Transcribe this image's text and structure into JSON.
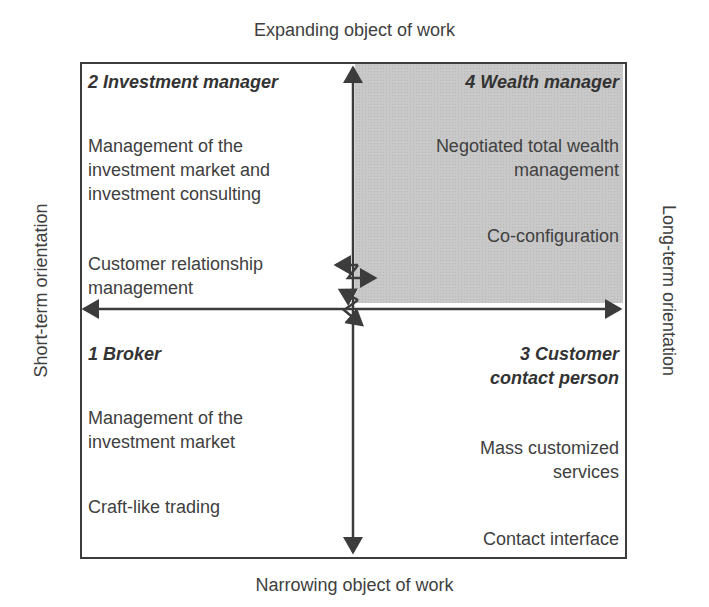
{
  "axes": {
    "top": "Expanding object of work",
    "bottom": "Narrowing object of work",
    "left": "Short-term orientation",
    "right": "Long-term orientation"
  },
  "quadrants": {
    "q2": {
      "title": "2 Investment manager",
      "items": [
        "Management of the investment market and investment consulting",
        "Customer relationship management"
      ],
      "lines": [
        "Management of the",
        "investment market and",
        "investment consulting",
        "Customer relationship",
        "management"
      ]
    },
    "q4": {
      "title": "4 Wealth manager",
      "shaded": true,
      "shade_color": "#c8c8c8",
      "items": [
        "Negotiated total wealth management",
        "Co-configuration"
      ],
      "lines": [
        "Negotiated total wealth",
        "management",
        "Co-configuration"
      ]
    },
    "q1": {
      "title": "1 Broker",
      "items": [
        "Management of the investment market",
        "Craft-like trading"
      ],
      "lines": [
        "Management of the",
        "investment market",
        "Craft-like trading"
      ]
    },
    "q3": {
      "title_lines": [
        "3 Customer",
        "contact person"
      ],
      "items": [
        "Mass customized services",
        "Contact interface"
      ],
      "lines": [
        "Mass customized",
        "services",
        "Contact interface"
      ]
    }
  },
  "colors": {
    "line": "#3c3c3c",
    "text": "#404040",
    "shade": "#c8c8c8"
  }
}
